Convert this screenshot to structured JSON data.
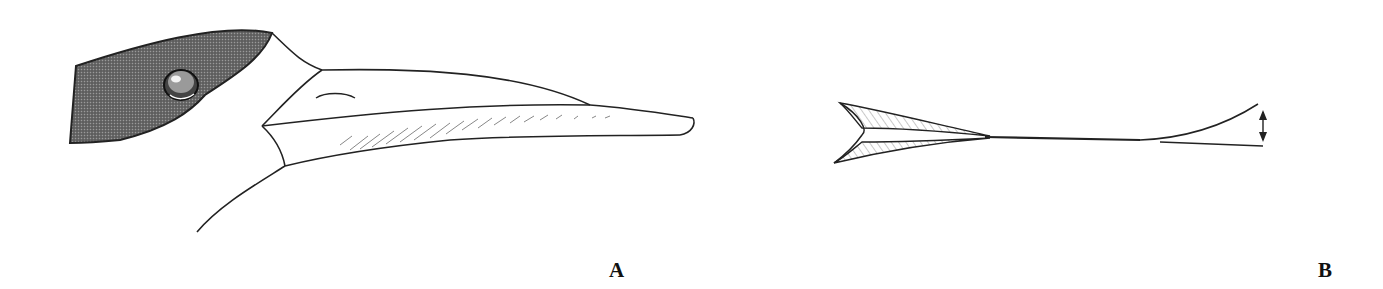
{
  "figure": {
    "panels": [
      {
        "label": "A",
        "subject": "side view of a bird head with long straight bill, dark cap/face patch and eye"
      },
      {
        "label": "B",
        "subject": "schematic of bill mandibles with hatched base and double-headed arrow indicating gape at tip"
      }
    ],
    "colors": {
      "line": "#222222",
      "dark_patch": "#5a5a5a",
      "hatch": "#888888",
      "background": "#ffffff"
    }
  }
}
